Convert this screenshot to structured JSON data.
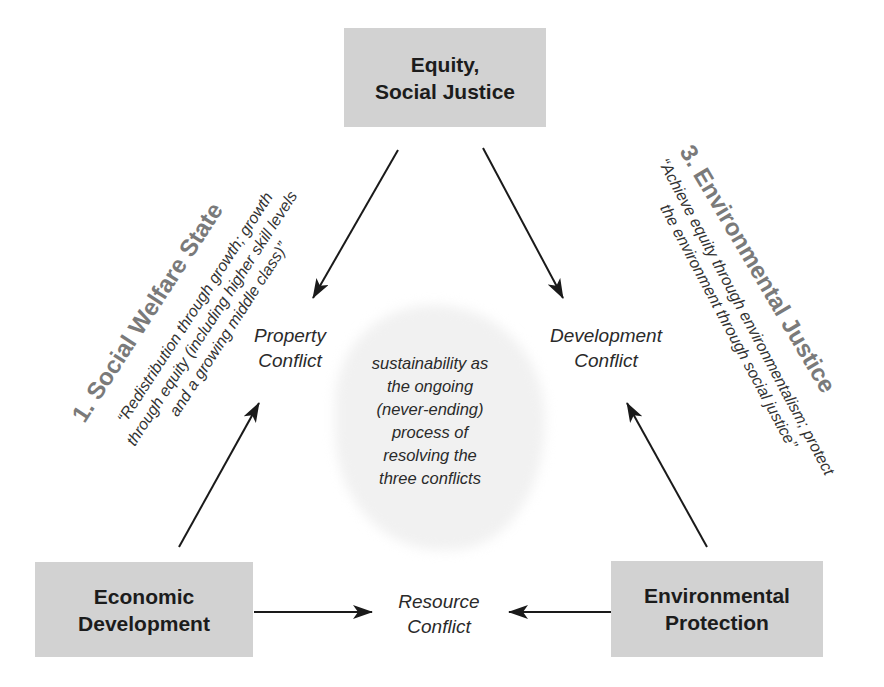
{
  "nodes": {
    "top": {
      "line1": "Equity,",
      "line2": "Social Justice"
    },
    "bottom_left": {
      "line1": "Economic",
      "line2": "Development"
    },
    "bottom_right": {
      "line1": "Environmental",
      "line2": "Protection"
    }
  },
  "conflicts": {
    "property": {
      "line1": "Property",
      "line2": "Conflict"
    },
    "development": {
      "line1": "Development",
      "line2": "Conflict"
    },
    "resource": {
      "line1": "Resource",
      "line2": "Conflict"
    }
  },
  "center": {
    "lines": [
      "sustainability as",
      "the ongoing",
      "(never-ending)",
      "process of",
      "resolving the",
      "three conflicts"
    ]
  },
  "sides": {
    "left": {
      "heading": "1. Social Welfare State",
      "quote_lines": [
        "“Redistribution through growth; growth",
        "through equity (including higher skill levels",
        "and a growing middle class)”"
      ]
    },
    "right": {
      "heading": "3. Environmental Justice",
      "quote_lines": [
        "“Achieve equity through environmentalism; protect",
        "the environment through social justice”"
      ]
    }
  },
  "colors": {
    "box_fill": "#d2d2d2",
    "heading_gray": "#7a7a7a",
    "cloud_fill": "#f1f1f1",
    "arrow": "#1a1a1a"
  }
}
